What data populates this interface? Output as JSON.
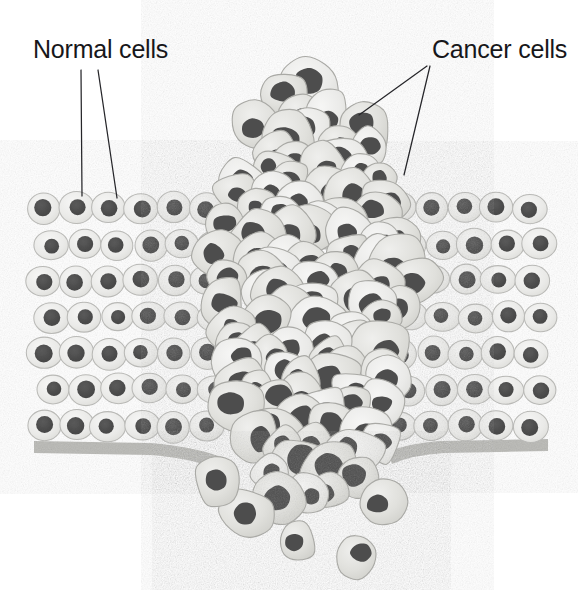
{
  "figure": {
    "background_color": "#ffffff",
    "width": 578,
    "height": 590
  },
  "labels": [
    {
      "id": "normal-cells",
      "text": "Normal cells",
      "x": 33,
      "y": 58,
      "anchor": "start"
    },
    {
      "id": "cancer-cells",
      "text": "Cancer cells",
      "x": 432,
      "y": 58,
      "anchor": "start"
    }
  ],
  "leader_lines": [
    {
      "id": "normal-leader-1",
      "x1": 81,
      "y1": 70,
      "x2": 82,
      "y2": 196
    },
    {
      "id": "normal-leader-2",
      "x1": 98,
      "y1": 70,
      "x2": 117,
      "y2": 198
    },
    {
      "id": "cancer-leader-1",
      "x1": 427,
      "y1": 66,
      "x2": 359,
      "y2": 115
    },
    {
      "id": "cancer-leader-2",
      "x1": 430,
      "y1": 66,
      "x2": 404,
      "y2": 175
    }
  ],
  "colors": {
    "cell_fill": "#ededec",
    "cell_fill_alt": "#e4e4e2",
    "cell_stroke": "#b9b9b6",
    "nucleus": "#4d4d4d",
    "nucleus_dark": "#474747",
    "tumor_fill": "#e0e0dd",
    "tumor_fill_alt": "#d7d7d3",
    "tumor_stroke": "#a9a9a5",
    "membrane": "#b4b4b0",
    "leader_line": "#26262a",
    "text": "#17171a",
    "background": "#ffffff"
  },
  "structures": {
    "basement_membrane": {
      "name": "basement-membrane",
      "description": "Gray band beneath the epithelium, broken where the tumour invades",
      "left_segment": {
        "x_start": 34,
        "x_end": 214,
        "y": 444,
        "thickness": 12
      },
      "right_segment": {
        "x_start": 392,
        "x_end": 546,
        "y": 442,
        "thickness": 12
      }
    },
    "normal_epithelium_left": {
      "name": "normal-epithelium-left",
      "x_start": 34,
      "x_end": 222,
      "y_top": 190,
      "y_bottom": 444,
      "rows": 7,
      "cell_rx": 17,
      "cell_ry": 15,
      "nucleus_r": 8.5
    },
    "normal_epithelium_right": {
      "name": "normal-epithelium-right",
      "x_start": 388,
      "x_end": 548,
      "y_top": 190,
      "y_bottom": 444,
      "rows": 7,
      "cell_rx": 17,
      "cell_ry": 15,
      "nucleus_r": 8.5
    },
    "tumor_mass": {
      "name": "tumor-mass",
      "x_center": 310,
      "x_min": 196,
      "x_max": 412,
      "y_top": 80,
      "y_bottom": 500,
      "description": "Disorganised column of irregular cancer cells bulging above the epithelium and breaking through the basement membrane"
    },
    "metastatic_cells": {
      "name": "metastatic-cells",
      "description": "Detached cancer cells scattered below the broken basement membrane",
      "cells": [
        {
          "cx": 247,
          "cy": 512,
          "r": 24,
          "rot": -18
        },
        {
          "cx": 297,
          "cy": 541,
          "r": 21,
          "rot": 14
        },
        {
          "cx": 357,
          "cy": 556,
          "r": 23,
          "rot": -6
        },
        {
          "cx": 217,
          "cy": 480,
          "r": 26,
          "rot": 22
        },
        {
          "cx": 383,
          "cy": 500,
          "r": 25,
          "rot": -25
        }
      ]
    }
  },
  "chart_data": {
    "type": "diagram",
    "annotations": [
      "Normal cells",
      "Cancer cells"
    ],
    "elements": [
      {
        "name": "normal epithelium",
        "count_rows": 7,
        "arrangement": "regular ordered rows, uniform oval cells with central round nuclei"
      },
      {
        "name": "cancer cell mass",
        "arrangement": "irregular, disorganised, varied sizes, off-centre nuclei"
      },
      {
        "name": "basement membrane",
        "state": "broken at the tumour site"
      },
      {
        "name": "metastatic cells",
        "count": 5,
        "location": "below the basement membrane"
      }
    ]
  }
}
